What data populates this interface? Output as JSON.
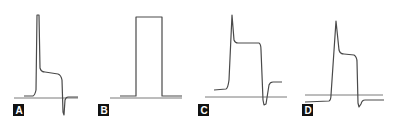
{
  "figure": {
    "panels": [
      {
        "id": "A",
        "label": "A",
        "description": "Action potential with sharp initial spike, sloping plateau, and negative undershoot"
      },
      {
        "id": "B",
        "label": "B",
        "description": "Rectangular (square) pulse"
      },
      {
        "id": "C",
        "label": "C",
        "description": "Action potential with spike, flat plateau, deep undershoot, resting above baseline"
      },
      {
        "id": "D",
        "label": "D",
        "description": "Action potential starting below baseline with spike and plateau, small undershoot"
      }
    ],
    "colors": {
      "trace": "#4a4a4a",
      "baseline": "#7a7a7a",
      "label_background": "#111111",
      "label_text": "#ffffff"
    }
  }
}
